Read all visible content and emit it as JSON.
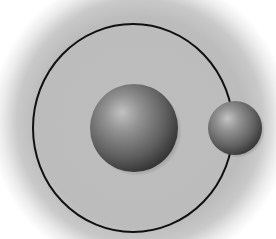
{
  "diagram": {
    "type": "orbit",
    "background": {
      "color": "#bdbdbd",
      "edge": "#ffffff",
      "cx": 140,
      "cy": 122,
      "r": 150
    },
    "orbit": {
      "cx": 133,
      "cy": 128,
      "rx": 100,
      "ry": 104,
      "stroke": "#111111",
      "stroke_width": 2
    },
    "central_body": {
      "cx": 134,
      "cy": 128,
      "r": 44,
      "highlight": "#c4c4c4",
      "mid": "#7a7a7a",
      "shadow": "#2e2e2e"
    },
    "orbiting_body": {
      "cx": 235,
      "cy": 128,
      "r": 27,
      "highlight": "#c4c4c4",
      "mid": "#7c7c7c",
      "shadow": "#333333"
    },
    "labels": []
  }
}
